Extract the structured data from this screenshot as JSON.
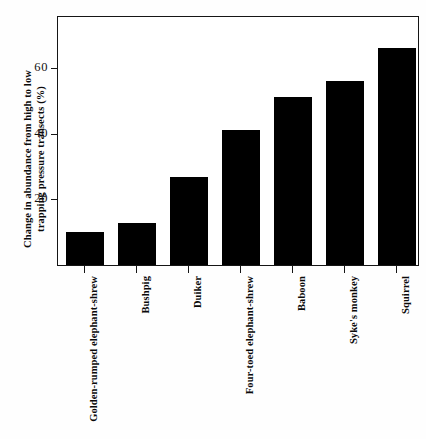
{
  "chart_data": {
    "type": "bar",
    "title": "",
    "xlabel": "",
    "ylabel": "Change in abundance from high to low trapping pressure transects (%)",
    "ylabel_lines": [
      "Change in abundance from high to low",
      "trapping pressure transects (%)"
    ],
    "categories": [
      "Golden-rumped elephant-shrew",
      "Bushpig",
      "Duiker",
      "Four-toed elephant-shrew",
      "Baboon",
      "Syke's monkey",
      "Squirrel"
    ],
    "values": [
      10,
      13,
      27,
      41.5,
      51.5,
      56.5,
      66.5
    ],
    "ylim": [
      0,
      76
    ],
    "yticks": [
      20,
      40,
      60
    ],
    "ytick_labels": [
      "20",
      "40",
      "60"
    ],
    "grid": false,
    "legend": null,
    "bar_color": "#000000",
    "axis_color": "#151515"
  },
  "figure": {
    "background": "#ffffff"
  }
}
